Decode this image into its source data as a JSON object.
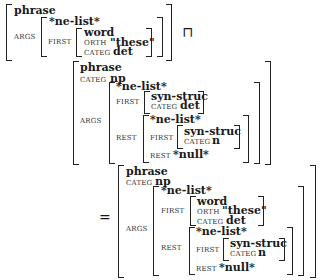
{
  "avm1": {
    "type": "phrase",
    "args_label": "ARGS",
    "args": {
      "type": "*ne-list*",
      "first_label": "FIRST",
      "first": {
        "type": "word",
        "orth_label": "ORTH",
        "orth": "\"these\"",
        "categ_label": "CATEG",
        "categ": "det"
      }
    }
  },
  "operator_unify": "⊓",
  "avm2": {
    "type": "phrase",
    "categ_label": "CATEG",
    "categ": "np",
    "args_label": "ARGS",
    "args": {
      "type": "*ne-list*",
      "first_label": "FIRST",
      "first": {
        "type": "syn-struc",
        "categ_label": "CATEG",
        "categ": "det"
      },
      "rest_label": "REST",
      "rest": {
        "type": "*ne-list*",
        "first_label": "FIRST",
        "first": {
          "type": "syn-struc",
          "categ_label": "CATEG",
          "categ": "n"
        },
        "rest_label": "REST",
        "rest": "*null*"
      }
    }
  },
  "operator_equals": "=",
  "avm3": {
    "type": "phrase",
    "categ_label": "CATEG",
    "categ": "np",
    "args_label": "ARGS",
    "args": {
      "type": "*ne-list*",
      "first_label": "FIRST",
      "first": {
        "type": "word",
        "orth_label": "ORTH",
        "orth": "\"these\"",
        "categ_label": "CATEG",
        "categ": "det"
      },
      "rest_label": "REST",
      "rest": {
        "type": "*ne-list*",
        "first_label": "FIRST",
        "first": {
          "type": "syn-struc",
          "categ_label": "CATEG",
          "categ": "n"
        },
        "rest_label": "REST",
        "rest": "*null*"
      }
    }
  }
}
